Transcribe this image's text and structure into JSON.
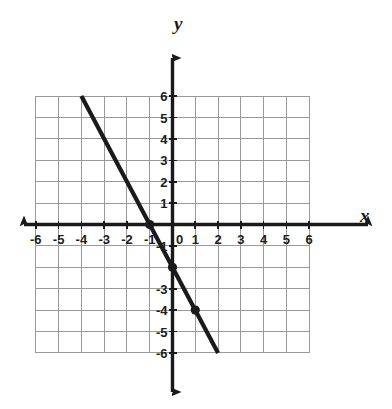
{
  "figure": {
    "title": "",
    "axis_labels": {
      "x": "x",
      "y": "y"
    },
    "colors": {
      "background": "#ffffff",
      "grid": "#9a9a9a",
      "axis": "#1a1a1a",
      "line": "#1a1a1a",
      "point": "#1a1a1a",
      "text": "#1c1c1c"
    }
  },
  "chart_data": {
    "type": "line",
    "title": "",
    "xlabel": "x",
    "ylabel": "y",
    "xlim": [
      -6,
      6
    ],
    "ylim": [
      -6,
      6
    ],
    "xticks": [
      -6,
      -5,
      -4,
      -3,
      -2,
      -1,
      0,
      1,
      2,
      3,
      4,
      5,
      6
    ],
    "yticks": [
      -6,
      -5,
      -4,
      -3,
      -2,
      -1,
      0,
      1,
      2,
      3,
      4,
      5,
      6
    ],
    "xtick_labels": [
      "-6",
      "-5",
      "-4",
      "-3",
      "-2",
      "-1",
      "0",
      "1",
      "2",
      "3",
      "4",
      "5",
      "6"
    ],
    "ytick_labels": [
      "-6",
      "-5",
      "-4",
      "-3",
      "-2",
      "-1",
      "",
      "1",
      "2",
      "3",
      "4",
      "5",
      "6"
    ],
    "grid": true,
    "legend": false,
    "series": [
      {
        "name": "line",
        "equation": "y = -2x - 2",
        "slope": -2,
        "y_intercept": -2,
        "x_intercept": -1,
        "endpoints": [
          {
            "x": -4,
            "y": 6
          },
          {
            "x": 2,
            "y": -6
          }
        ],
        "marked_points": [
          {
            "x": -1,
            "y": 0
          },
          {
            "x": 0,
            "y": -2
          },
          {
            "x": 1,
            "y": -4
          }
        ]
      }
    ],
    "axis_arrows": {
      "x_left": true,
      "x_right": true,
      "y_up": true,
      "y_down": true
    }
  },
  "ticks": {
    "x": [
      {
        "value": -6,
        "label": "-6"
      },
      {
        "value": -5,
        "label": "-5"
      },
      {
        "value": -4,
        "label": "-4"
      },
      {
        "value": -3,
        "label": "-3"
      },
      {
        "value": -2,
        "label": "-2"
      },
      {
        "value": -1,
        "label": "-1"
      },
      {
        "value": 0,
        "label": "0"
      },
      {
        "value": 1,
        "label": "1"
      },
      {
        "value": 2,
        "label": "2"
      },
      {
        "value": 3,
        "label": "3"
      },
      {
        "value": 4,
        "label": "4"
      },
      {
        "value": 5,
        "label": "5"
      },
      {
        "value": 6,
        "label": "6"
      }
    ],
    "y": [
      {
        "value": 6,
        "label": "6"
      },
      {
        "value": 5,
        "label": "5"
      },
      {
        "value": 4,
        "label": "4"
      },
      {
        "value": 3,
        "label": "3"
      },
      {
        "value": 2,
        "label": "2"
      },
      {
        "value": 1,
        "label": "1"
      },
      {
        "value": -1,
        "label": "-1"
      },
      {
        "value": -3,
        "label": "-3"
      },
      {
        "value": -4,
        "label": "-4"
      },
      {
        "value": -5,
        "label": "-5"
      },
      {
        "value": -6,
        "label": "-6"
      }
    ]
  }
}
